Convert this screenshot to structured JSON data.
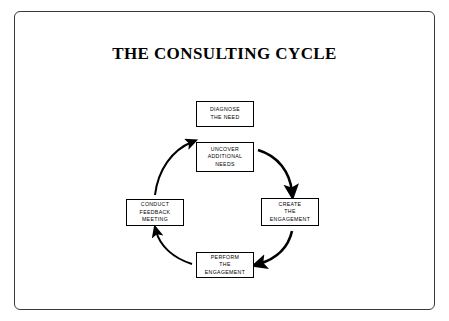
{
  "title": "THE CONSULTING CYCLE",
  "colors": {
    "frame_border": "#3a3a3a",
    "node_border": "#000000",
    "arrow": "#000000",
    "background": "#ffffff",
    "text": "#000000"
  },
  "diagram": {
    "type": "cycle",
    "nodes": [
      {
        "id": "diagnose",
        "lines": [
          "DIAGNOSE",
          "THE NEED"
        ]
      },
      {
        "id": "uncover",
        "lines": [
          "UNCOVER",
          "ADDITIONAL",
          "NEEDS"
        ]
      },
      {
        "id": "create",
        "lines": [
          "CREATE",
          "THE",
          "ENGAGEMENT"
        ]
      },
      {
        "id": "perform",
        "lines": [
          "PERFORM",
          "THE",
          "ENGAGEMENT"
        ]
      },
      {
        "id": "conduct",
        "lines": [
          "CONDUCT",
          "FEEDBACK",
          "MEETING"
        ]
      }
    ],
    "arrows": [
      {
        "from": "uncover",
        "to": "create"
      },
      {
        "from": "create",
        "to": "perform"
      },
      {
        "from": "perform",
        "to": "conduct"
      },
      {
        "from": "conduct",
        "to": "diagnose"
      }
    ]
  }
}
